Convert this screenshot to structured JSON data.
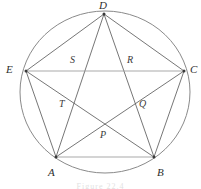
{
  "figure": {
    "type": "geometry-diagram",
    "caption": "Figure 22.4",
    "caption_visible": "clipped",
    "colors": {
      "circle_stroke": "#8a8a8a",
      "chord_stroke": "#5d5d5d",
      "chord_stroke_light": "#9a9a9a",
      "label_color": "#2e2e2e",
      "background": "#ffffff"
    },
    "circle": {
      "cx": 105,
      "cy": 92,
      "rx": 85,
      "ry": 81
    },
    "vertices": [
      {
        "id": "D",
        "label": "D",
        "x": 104,
        "y": 14,
        "label_x": 99,
        "label_y": 0
      },
      {
        "id": "E",
        "label": "E",
        "x": 26,
        "y": 71,
        "label_x": 6,
        "label_y": 64
      },
      {
        "id": "C",
        "label": "C",
        "x": 184,
        "y": 71,
        "label_x": 190,
        "label_y": 64
      },
      {
        "id": "A",
        "label": "A",
        "x": 56,
        "y": 157,
        "label_x": 48,
        "label_y": 167
      },
      {
        "id": "B",
        "label": "B",
        "x": 154,
        "y": 157,
        "label_x": 157,
        "label_y": 167
      }
    ],
    "intersections": [
      {
        "id": "S",
        "label": "S",
        "x": 80,
        "y": 71,
        "label_x": 70,
        "label_y": 55
      },
      {
        "id": "R",
        "label": "R",
        "x": 128,
        "y": 71,
        "label_x": 127,
        "label_y": 55
      },
      {
        "id": "T",
        "label": "T",
        "x": 70,
        "y": 108,
        "label_x": 59,
        "label_y": 99
      },
      {
        "id": "Q",
        "label": "Q",
        "x": 138,
        "y": 108,
        "label_x": 139,
        "label_y": 99
      },
      {
        "id": "P",
        "label": "P",
        "x": 104,
        "y": 131,
        "label_x": 100,
        "label_y": 130
      }
    ],
    "chords": [
      {
        "from": "D",
        "to": "E",
        "light": false
      },
      {
        "from": "D",
        "to": "C",
        "light": false
      },
      {
        "from": "D",
        "to": "A",
        "light": false
      },
      {
        "from": "D",
        "to": "B",
        "light": false
      },
      {
        "from": "E",
        "to": "C",
        "light": true
      },
      {
        "from": "E",
        "to": "A",
        "light": false
      },
      {
        "from": "E",
        "to": "B",
        "light": false
      },
      {
        "from": "C",
        "to": "A",
        "light": false
      },
      {
        "from": "C",
        "to": "B",
        "light": false
      },
      {
        "from": "A",
        "to": "B",
        "light": true
      }
    ]
  }
}
